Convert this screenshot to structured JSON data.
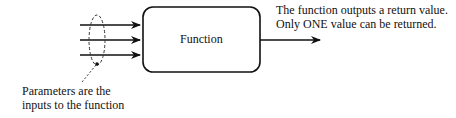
{
  "diagram": {
    "box_label": "Function",
    "output_note": [
      "The function outputs a return value.",
      "Only ONE value can be returned."
    ],
    "params_note": [
      "Parameters are the",
      "inputs to the function"
    ],
    "input_arrow_count": 3,
    "output_arrow_count": 1
  }
}
